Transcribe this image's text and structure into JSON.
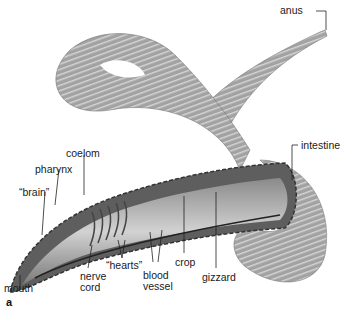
{
  "figure": {
    "panel_label": "a",
    "colors": {
      "body": "#9a9a9a",
      "body_dark": "#6e6e6e",
      "interior": "#c8c8c8",
      "ink": "#1a1a1a"
    }
  },
  "labels": {
    "anus": "anus",
    "intestine": "intestine",
    "coelom": "coelom",
    "pharynx": "pharynx",
    "brain": "“brain”",
    "hearts": "“hearts”",
    "mouth": "mouth",
    "nerve_cord_1": "nerve",
    "nerve_cord_2": "cord",
    "blood_vessel_1": "blood",
    "blood_vessel_2": "vessel",
    "crop": "crop",
    "gizzard": "gizzard"
  }
}
